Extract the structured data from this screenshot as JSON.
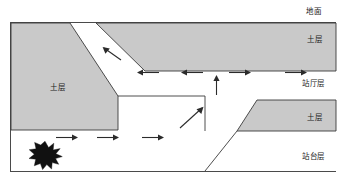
{
  "figure": {
    "caption": "",
    "colors": {
      "soil_fill": "#c9c9c9",
      "soil_stroke": "#3a3a3a",
      "arrow": "#2b2b2b",
      "explosion": "#111111",
      "frame": "#4a4a4a",
      "background": "#ffffff",
      "text": "#1a1a1a"
    },
    "labels": {
      "ground": "地面",
      "soil_top_right": "土层",
      "soil_mid_right": "土层",
      "soil_left": "土层",
      "station_hall": "站厅层",
      "station_platform": "站台层"
    },
    "legend_icons": {
      "explosion": "explosion-star-icon",
      "flow_arrow": "flow-arrow-icon"
    },
    "flows": {
      "hall_level": [
        {
          "name": "hall-arrow-1",
          "direction": "left"
        },
        {
          "name": "hall-arrow-2",
          "direction": "left"
        },
        {
          "name": "hall-arrow-3",
          "direction": "right"
        },
        {
          "name": "hall-arrow-4",
          "direction": "right"
        }
      ],
      "platform_level": [
        {
          "name": "platform-arrow-1",
          "direction": "right"
        },
        {
          "name": "platform-arrow-2",
          "direction": "right"
        },
        {
          "name": "platform-arrow-3",
          "direction": "right"
        }
      ],
      "stair_up": {
        "name": "stair-arrow-up-diagonal",
        "direction": "up-right"
      },
      "vertical_up": {
        "name": "vent-arrow-up",
        "direction": "up"
      },
      "exit_up_left": {
        "name": "exit-arrow-up-left",
        "direction": "up-left"
      }
    },
    "source": {
      "name": "explosion-source",
      "level": "站台层"
    }
  }
}
